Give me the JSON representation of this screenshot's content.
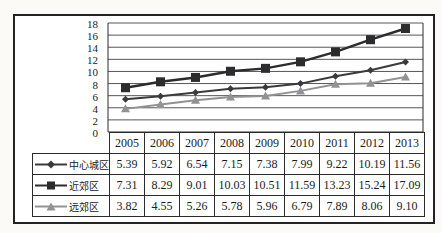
{
  "colors": {
    "frame_border": "#232323",
    "gridline": "#565656",
    "axis": "#2b2b2b",
    "table_border": "#2b2b2b",
    "text": "#1b1b1b"
  },
  "chart_data": {
    "type": "line",
    "title": "",
    "xlabel": "",
    "ylabel": "",
    "categories": [
      "2005",
      "2006",
      "2007",
      "2008",
      "2009",
      "2010",
      "2011",
      "2012",
      "2013"
    ],
    "series": [
      {
        "name": "中心城区",
        "marker": "diamond",
        "color": "#3a3a3c",
        "values": [
          5.39,
          5.92,
          6.54,
          7.15,
          7.38,
          7.99,
          9.22,
          10.19,
          11.56
        ]
      },
      {
        "name": "近郊区",
        "marker": "square",
        "color": "#2c2c2e",
        "values": [
          7.31,
          8.29,
          9.01,
          10.03,
          10.51,
          11.59,
          13.23,
          15.24,
          17.09
        ]
      },
      {
        "name": "远郊区",
        "marker": "triangle",
        "color": "#929294",
        "values": [
          3.82,
          4.55,
          5.26,
          5.78,
          5.96,
          6.79,
          7.89,
          8.06,
          9.1
        ]
      }
    ],
    "ylim": [
      0,
      18
    ],
    "yticks": [
      0,
      2,
      4,
      6,
      8,
      10,
      12,
      14,
      16,
      18
    ],
    "grid": true,
    "legend_position": "data-table-left-column",
    "data_table": true,
    "value_decimals": 2
  }
}
